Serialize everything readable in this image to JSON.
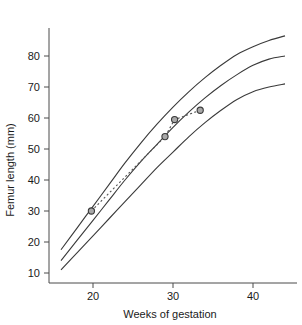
{
  "chart_data": {
    "type": "line",
    "title": "",
    "xlabel": "Weeks of gestation",
    "ylabel": "Femur length (mm)",
    "xlim": [
      14.5,
      45.5
    ],
    "ylim": [
      6,
      90
    ],
    "xticks": [
      20,
      30,
      40
    ],
    "yticks": [
      10,
      20,
      30,
      40,
      50,
      60,
      70,
      80
    ],
    "grid": false,
    "legend": "none",
    "series": [
      {
        "name": "Upper reference centile",
        "style": "solid",
        "x": [
          16,
          18,
          20,
          22,
          24,
          26,
          28,
          30,
          32,
          34,
          36,
          38,
          40,
          42,
          44
        ],
        "values": [
          17.5,
          24.5,
          31.5,
          38.5,
          45.5,
          52.0,
          58.0,
          63.5,
          68.5,
          73.0,
          77.0,
          80.5,
          83.0,
          85.0,
          86.5
        ]
      },
      {
        "name": "Median reference centile",
        "style": "solid",
        "x": [
          16,
          18,
          20,
          22,
          24,
          26,
          28,
          30,
          32,
          34,
          36,
          38,
          40,
          42,
          44
        ],
        "values": [
          14.0,
          20.5,
          27.0,
          33.5,
          40.0,
          46.0,
          51.5,
          57.0,
          62.0,
          66.5,
          70.5,
          74.0,
          77.0,
          79.0,
          80.0
        ]
      },
      {
        "name": "Lower reference centile",
        "style": "solid",
        "x": [
          16,
          18,
          20,
          22,
          24,
          26,
          28,
          30,
          32,
          34,
          36,
          38,
          40,
          42,
          44
        ],
        "values": [
          11.0,
          16.5,
          22.0,
          27.5,
          33.0,
          38.5,
          44.0,
          49.0,
          54.0,
          58.5,
          62.5,
          66.0,
          68.5,
          70.0,
          71.0
        ]
      },
      {
        "name": "Measured femur length",
        "style": "dotted-with-markers",
        "x": [
          19.8,
          29.0,
          30.2,
          33.4
        ],
        "values": [
          30.0,
          54.0,
          59.5,
          62.5
        ]
      }
    ]
  },
  "axes": {
    "x_tick_labels": [
      "20",
      "30",
      "40"
    ],
    "y_tick_labels": [
      "10",
      "20",
      "30",
      "40",
      "50",
      "60",
      "70",
      "80"
    ],
    "x_axis_title": "Weeks of gestation",
    "y_axis_title": "Femur length (mm)"
  }
}
